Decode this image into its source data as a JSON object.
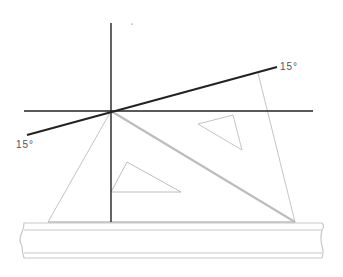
{
  "diagram": {
    "labels": {
      "angle_upper": "15°",
      "angle_lower": "15°"
    },
    "colors": {
      "construction_line": "#222222",
      "set_square": "#bdbdbd",
      "ruler": "#c8c8c8",
      "label": "#555555"
    },
    "elements": [
      "vertical-axis-line",
      "horizontal-axis-line",
      "15-degree-line",
      "45-degree-set-square",
      "30-60-set-square",
      "t-square-ruler"
    ]
  }
}
